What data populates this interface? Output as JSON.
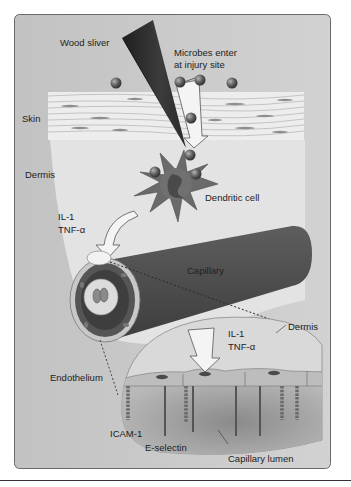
{
  "figure": {
    "labels": {
      "wood_sliver": "Wood sliver",
      "microbes_line1": "Microbes enter",
      "microbes_line2": "at injury site",
      "skin": "Skin",
      "dermis_left": "Dermis",
      "dendritic_cell": "Dendritic cell",
      "il1_upper": "IL-1",
      "tnf_upper": "TNF-α",
      "capillary": "Capillary",
      "il1_lower": "IL-1",
      "tnf_lower": "TNF-α",
      "dermis_inset": "Dermis",
      "endothelium": "Endothelium",
      "icam1": "ICAM-1",
      "e_selectin": "E-selectin",
      "capillary_lumen": "Capillary lumen"
    },
    "colors": {
      "panel_bg": "#c9c9c9",
      "dermis_light": "#e4e4e4",
      "skin_band": "#ececec",
      "sliver": "#2e2e2e",
      "microbe": "#5a5a5a",
      "dendritic_cell": "#6a6a6a",
      "capillary": "#4f4f4f",
      "capillary_cap": "#3a3a3a",
      "inset_fill": "#d8d8d8",
      "lumen": "#9a9a9a",
      "endothelium": "#bdbdbd",
      "arrow_fill": "#f4f4f4",
      "frame": "#555555"
    }
  }
}
